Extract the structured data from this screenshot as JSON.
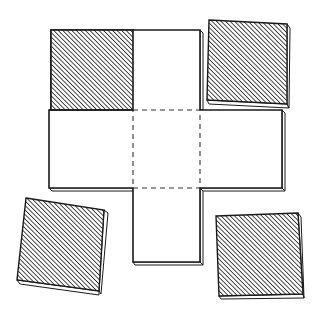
{
  "figure": {
    "colors": {
      "background": "#ffffff",
      "stroke": "#1a1a1a",
      "hatch": "#2a2a2a",
      "edge_shadow": "#bdbdbd"
    },
    "net": {
      "shape": "cross",
      "attached_hatched_face": "top-left",
      "center_square_style": "dashed",
      "faces_visible": 6
    },
    "loose_tiles": [
      {
        "position": "top-right",
        "pattern": "diagonal-hatch"
      },
      {
        "position": "bottom-left",
        "pattern": "diagonal-hatch"
      },
      {
        "position": "bottom-right",
        "pattern": "diagonal-hatch"
      }
    ]
  }
}
